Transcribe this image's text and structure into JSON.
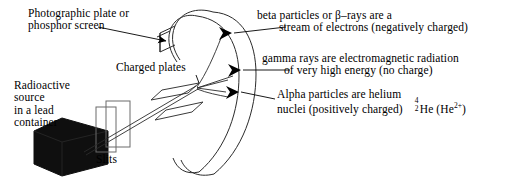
{
  "diagram": {
    "type": "physics-schematic",
    "background_color": "#ffffff",
    "ink_color": "#000000"
  },
  "labels": {
    "photographic_plate": {
      "line1": "Photographic plate or",
      "line2": "phosphor screen"
    },
    "charged_plates": "Charged plates",
    "radioactive_source": {
      "line1": "Radioactive",
      "line2": "source",
      "line3": "in a lead",
      "line4": "container"
    },
    "slits": "Slits",
    "beta": {
      "line1": "beta particles or β–rays are a",
      "line2": "stream of electrons (negatively charged)"
    },
    "gamma": {
      "line1": "gamma rays are electromagnetic radiation",
      "line2": "of very high energy (no charge)"
    },
    "alpha": {
      "line1": "Alpha particles are helium",
      "line2": "nuclei (positively charged)",
      "isotope_mass": "4",
      "isotope_atomic": "2",
      "isotope_symbol": "He",
      "isotope_ion": "(He",
      "isotope_charge": "2+",
      "isotope_close": ")"
    }
  },
  "parts": {
    "screen": "curved-phosphor-screen",
    "plate_upper": "upper-charged-plate",
    "plate_lower": "lower-charged-plate",
    "source_box": "lead-container-box",
    "slit_front": "slit-plate-front",
    "slit_back": "slit-plate-back",
    "beam_beta": "beta-beam-path",
    "beam_gamma": "gamma-beam-path",
    "beam_alpha": "alpha-beam-path"
  }
}
